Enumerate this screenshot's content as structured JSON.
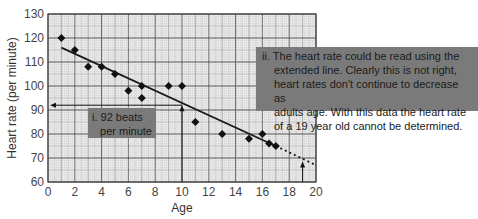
{
  "chart_data": {
    "type": "scatter",
    "title": "",
    "xlabel": "Age",
    "ylabel": "Heart rate (per minute)",
    "xlim": [
      0,
      20
    ],
    "ylim": [
      60,
      130
    ],
    "x_ticks": [
      "0",
      "2",
      "4",
      "6",
      "8",
      "10",
      "12",
      "14",
      "16",
      "18",
      "20"
    ],
    "y_ticks": [
      "60",
      "70",
      "80",
      "90",
      "100",
      "110",
      "120",
      "130"
    ],
    "grid": true,
    "points": [
      {
        "x": 1,
        "y": 120
      },
      {
        "x": 2,
        "y": 115
      },
      {
        "x": 3,
        "y": 108
      },
      {
        "x": 4,
        "y": 108
      },
      {
        "x": 5,
        "y": 105
      },
      {
        "x": 6,
        "y": 98
      },
      {
        "x": 7,
        "y": 100
      },
      {
        "x": 7,
        "y": 95
      },
      {
        "x": 9,
        "y": 100
      },
      {
        "x": 10,
        "y": 100
      },
      {
        "x": 11,
        "y": 85
      },
      {
        "x": 13,
        "y": 80
      },
      {
        "x": 15,
        "y": 78
      },
      {
        "x": 16,
        "y": 80
      },
      {
        "x": 16.5,
        "y": 76
      },
      {
        "x": 17,
        "y": 75
      }
    ],
    "best_fit_line": {
      "x1": 1,
      "y1": 116,
      "x2": 17,
      "y2": 75
    },
    "extended_line": {
      "x1": 17,
      "y1": 75,
      "x2": 20,
      "y2": 67,
      "style": "dashed"
    },
    "annotations": [
      {
        "id": "i",
        "text": "i. 92 beats per minute",
        "read_x": 10,
        "read_y": 92
      },
      {
        "id": "ii",
        "text": "ii. The heart rate could be read using the extended line. Clearly this is not right, heart rates don't continue to decrease as adults age. With this data the heart rate of a 19 year old cannot be determined.",
        "read_x": 19
      }
    ]
  },
  "annotations": {
    "i_line1": "i. 92 beats",
    "i_line2": "per minute",
    "ii_lines": [
      "ii. The heart rate could be read using the",
      "extended line. Clearly this is not right,",
      "heart rates don't continue to decrease as",
      "adults age. With this data the heart rate",
      "of a 19 year old cannot be determined."
    ]
  },
  "colors": {
    "grid_major": "#555555",
    "grid_minor": "#aaaaaa",
    "plot_bg": "#e6e6e6",
    "line": "#1a1a1a",
    "box": "#7a7a7a"
  }
}
